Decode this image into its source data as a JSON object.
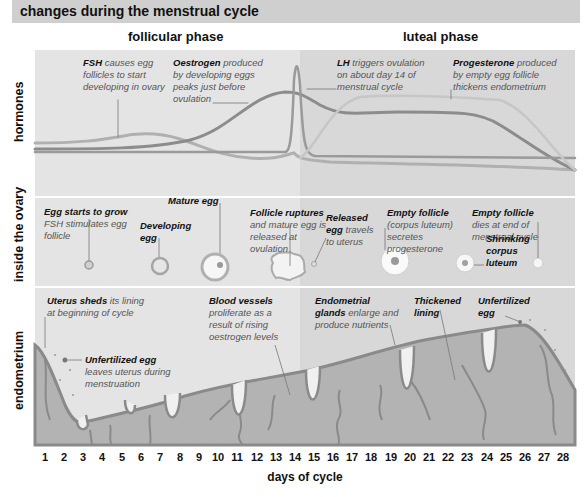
{
  "title": "changes during the menstrual cycle",
  "phases": {
    "follicular": "follicular phase",
    "luteal": "luteal phase"
  },
  "rows": {
    "hormones": "hormones",
    "ovary": "inside the ovary",
    "endometrium": "endometrium"
  },
  "hormones": {
    "fsh": {
      "term": "FSH",
      "text": " causes egg follicles to start developing in ovary"
    },
    "oestrogen": {
      "term": "Oestrogen",
      "text": " produced by developing eggs peaks just before ovulation"
    },
    "lh": {
      "term": "LH",
      "text": " triggers ovulation on about day 14 of menstrual cycle"
    },
    "progesterone": {
      "term": "Progesterone",
      "text": " produced by empty egg follicle thickens endometrium"
    }
  },
  "ovary": {
    "egg_starts": {
      "term": "Egg starts to grow",
      "text": "FSH stimulates egg follicle"
    },
    "developing": {
      "term": "Developing egg"
    },
    "mature": {
      "term": "Mature egg"
    },
    "ruptures": {
      "term": "Follicle ruptures",
      "text": " and mature egg is released at ovulation"
    },
    "released": {
      "term": "Released egg",
      "text": " travels to uterus"
    },
    "empty1": {
      "term": "Empty follicle",
      "text": "(corpus luteum) secretes progesterone"
    },
    "empty2": {
      "term": "Empty follicle",
      "text": "dies at end of menstrual cycle"
    },
    "shrinking": {
      "term": "Shrinking corpus luteum"
    }
  },
  "endometrium": {
    "uterus_sheds": {
      "term": "Uterus sheds",
      "text": " its lining at beginning of cycle"
    },
    "unfertilized1": {
      "term": "Unfertilized egg",
      "text": "leaves uterus during menstruation"
    },
    "blood_vessels": {
      "term": "Blood vessels",
      "text": " proliferate as a result of rising oestrogen levels"
    },
    "glands": {
      "term": "Endometrial glands",
      "text": " enlarge and produce nutrients"
    },
    "thickened": {
      "term": "Thickened lining"
    },
    "unfertilized2": {
      "term": "Unfertilized egg"
    }
  },
  "x_axis": {
    "label": "days of cycle",
    "days": [
      "1",
      "2",
      "3",
      "4",
      "5",
      "6",
      "7",
      "8",
      "9",
      "10",
      "11",
      "12",
      "13",
      "14",
      "15",
      "16",
      "17",
      "18",
      "19",
      "20",
      "21",
      "22",
      "23",
      "24",
      "25",
      "26",
      "27",
      "28"
    ]
  },
  "colors": {
    "header": "#cfcfcf",
    "panel_follicular": "#e4e4e4",
    "panel_luteal": "#d8d8d8",
    "curve_dark": "#8c8c8c",
    "curve_light": "#b8b8b8",
    "tissue": "#b3b3b3",
    "tissue_edge": "#8a8a8a"
  }
}
